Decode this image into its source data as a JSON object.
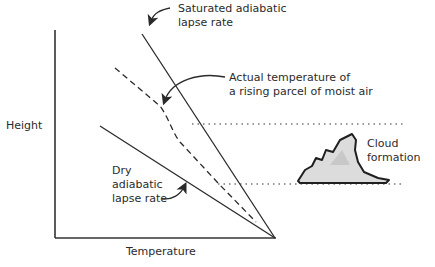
{
  "diagram": {
    "axes": {
      "y_label": "Height",
      "x_label": "Temperature"
    },
    "labels": {
      "saturated_line1": "Saturated adiabatic",
      "saturated_line2": "lapse rate",
      "actual_line1": "Actual temperature of",
      "actual_line2": "a rising parcel of moist air",
      "dry_line1": "Dry",
      "dry_line2": "adiabatic",
      "dry_line3": "lapse rate",
      "cloud_line1": "Cloud",
      "cloud_line2": "formation"
    },
    "colors": {
      "line": "#2a2a2a",
      "cloud_fill": "#d9d9d9",
      "background": "#ffffff"
    }
  }
}
